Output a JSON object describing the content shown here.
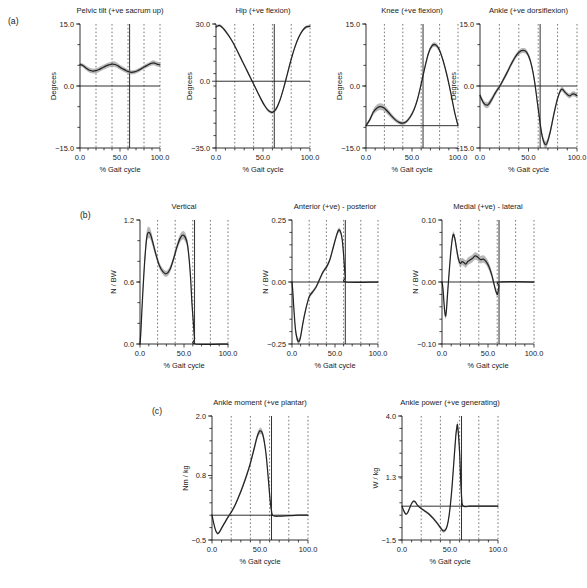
{
  "figure": {
    "width": 587,
    "height": 588,
    "background": "#ffffff",
    "curve_color": "#242424",
    "band_color": "#8c8c8c",
    "grid_color": "#4d4d4d",
    "axis_color": "#1a1a1a"
  },
  "row_labels": {
    "a": "(a)",
    "b": "(b)",
    "c": "(c)"
  },
  "common": {
    "xlabel": "% Gait cycle",
    "xticks": [
      0.0,
      50.0,
      100.0
    ],
    "xticklabels": [
      "0.0",
      "50.0",
      "100.0"
    ],
    "xlim": [
      0,
      100
    ],
    "xminor_step": 10,
    "grid_dotted_x": [
      20,
      40,
      60,
      80
    ],
    "toe_off": 62
  },
  "chart_data": [
    {
      "id": "pelvic-tilt",
      "type": "line",
      "row": "a",
      "title": "Pelvic tilt (+ve sacrum up)",
      "xlabel": "% Gait cycle",
      "ylabel": "Degrees",
      "ylim": [
        -15.0,
        15.0
      ],
      "yticks": [
        -15.0,
        0.0,
        15.0
      ],
      "yticklabels": [
        "−15.0",
        "0.0",
        "15.0"
      ],
      "yminor_step": 5.0,
      "reference_line_y": 0.0,
      "toe_off": 62,
      "x": [
        0,
        4,
        8,
        12,
        16,
        20,
        24,
        28,
        32,
        36,
        40,
        44,
        48,
        52,
        56,
        60,
        64,
        68,
        72,
        76,
        80,
        84,
        88,
        92,
        96,
        100
      ],
      "mean": [
        5.2,
        4.9,
        4.3,
        3.8,
        3.6,
        3.7,
        4.0,
        4.4,
        4.8,
        5.1,
        5.3,
        5.2,
        4.8,
        4.3,
        3.9,
        3.5,
        3.3,
        3.4,
        3.7,
        4.1,
        4.6,
        5.0,
        5.4,
        5.6,
        5.3,
        5.1
      ],
      "sd": [
        0.45,
        0.5,
        0.55,
        0.6,
        0.6,
        0.6,
        0.6,
        0.6,
        0.6,
        0.6,
        0.65,
        0.65,
        0.6,
        0.6,
        0.55,
        0.5,
        0.5,
        0.5,
        0.5,
        0.5,
        0.5,
        0.5,
        0.55,
        0.6,
        0.6,
        0.55
      ]
    },
    {
      "id": "hip",
      "type": "line",
      "row": "a",
      "title": "Hip (+ve flexion)",
      "xlabel": "% Gait cycle",
      "ylabel": "Degrees",
      "ylim": [
        -35.0,
        30.0
      ],
      "yticks": [
        -35.0,
        0.0,
        30.0
      ],
      "yticklabels": [
        "−35.0",
        "0.0",
        "30.0"
      ],
      "yminor_step": 6.5,
      "reference_line_y": 0.0,
      "toe_off": 62,
      "x": [
        0,
        4,
        8,
        12,
        16,
        20,
        24,
        28,
        32,
        36,
        40,
        44,
        48,
        52,
        56,
        60,
        64,
        68,
        72,
        76,
        80,
        84,
        88,
        92,
        96,
        100
      ],
      "mean": [
        28.5,
        29.2,
        27.5,
        25.0,
        22.0,
        18.5,
        14.5,
        10.5,
        6.5,
        2.5,
        -1.5,
        -5.5,
        -9.5,
        -13.0,
        -15.5,
        -16.3,
        -14.5,
        -10.0,
        -3.5,
        4.0,
        11.5,
        18.0,
        23.0,
        26.5,
        28.5,
        28.8
      ],
      "sd": [
        0.7,
        0.7,
        0.7,
        0.7,
        0.7,
        0.7,
        0.7,
        0.7,
        0.7,
        0.7,
        0.7,
        0.7,
        0.8,
        0.8,
        0.8,
        0.8,
        0.8,
        0.8,
        0.8,
        0.8,
        0.8,
        0.8,
        0.7,
        0.7,
        0.7,
        0.7
      ]
    },
    {
      "id": "knee",
      "type": "line",
      "row": "a",
      "title": "Knee (+ve flexion)",
      "xlabel": "% Gait cycle",
      "ylabel": "Degrees",
      "ylim": [
        -15.0,
        15.0
      ],
      "yticks": [
        -15.0,
        0.0,
        15.0
      ],
      "yticklabels": [
        "−15.0",
        "0.0",
        "15.0"
      ],
      "yminor_step": 5.0,
      "reference_line_y": -9.6,
      "toe_off": 62,
      "x": [
        0,
        4,
        8,
        12,
        16,
        20,
        24,
        28,
        32,
        36,
        40,
        44,
        48,
        52,
        56,
        60,
        64,
        68,
        72,
        76,
        80,
        84,
        88,
        92,
        96,
        100
      ],
      "mean": [
        -9.6,
        -8.2,
        -6.3,
        -5.3,
        -5.0,
        -5.4,
        -6.3,
        -7.3,
        -8.2,
        -8.8,
        -9.0,
        -8.6,
        -7.5,
        -5.8,
        -3.2,
        0.5,
        4.5,
        8.0,
        9.8,
        9.9,
        8.6,
        6.0,
        2.6,
        -1.5,
        -6.0,
        -9.6
      ],
      "sd": [
        0.3,
        0.5,
        0.7,
        0.8,
        0.8,
        0.75,
        0.7,
        0.6,
        0.5,
        0.45,
        0.4,
        0.4,
        0.4,
        0.4,
        0.4,
        0.45,
        0.5,
        0.5,
        0.55,
        0.55,
        0.5,
        0.5,
        0.45,
        0.4,
        0.35,
        0.3
      ]
    },
    {
      "id": "ankle-angle",
      "type": "line",
      "row": "a",
      "title": "Ankle (+ve dorsiflexion)",
      "xlabel": "% Gait cycle",
      "ylabel": "Degrees",
      "ylim": [
        -15.0,
        15.0
      ],
      "yticks": [
        -15.0,
        0.0,
        15.0
      ],
      "yticklabels": [
        "−15.0",
        "0.0",
        "15.0"
      ],
      "yminor_step": 5.0,
      "reference_line_y": 0.0,
      "toe_off": 62,
      "x": [
        0,
        4,
        8,
        12,
        16,
        20,
        24,
        28,
        32,
        36,
        40,
        44,
        48,
        52,
        56,
        60,
        64,
        68,
        72,
        76,
        80,
        84,
        88,
        92,
        96,
        100
      ],
      "mean": [
        -2.3,
        -4.2,
        -4.6,
        -3.3,
        -1.6,
        -0.2,
        1.5,
        3.3,
        5.2,
        6.9,
        8.1,
        8.6,
        8.2,
        6.0,
        1.5,
        -5.5,
        -12.0,
        -14.2,
        -11.5,
        -7.0,
        -3.0,
        -0.8,
        -1.6,
        -2.4,
        -1.9,
        -2.3
      ],
      "sd": [
        0.6,
        0.7,
        0.75,
        0.7,
        0.6,
        0.55,
        0.55,
        0.55,
        0.55,
        0.6,
        0.6,
        0.6,
        0.6,
        0.6,
        0.65,
        0.7,
        0.8,
        0.85,
        0.8,
        0.7,
        0.6,
        0.55,
        0.6,
        0.6,
        0.6,
        0.6
      ]
    },
    {
      "id": "grf-vertical",
      "type": "line",
      "row": "b",
      "title": "Vertical",
      "xlabel": "% Gait cycle",
      "ylabel": "N / BW",
      "ylim": [
        0.0,
        1.2
      ],
      "yticks": [
        0.0,
        0.6,
        1.2
      ],
      "yticklabels": [
        "0.0",
        "0.6",
        "1.2"
      ],
      "yminor_step": 0.2,
      "reference_line_y": null,
      "toe_off": 62,
      "x": [
        0,
        1,
        2,
        4,
        6,
        8,
        10,
        12,
        14,
        18,
        22,
        26,
        30,
        34,
        38,
        42,
        46,
        50,
        54,
        57,
        59,
        60,
        61,
        62,
        63,
        100
      ],
      "mean": [
        0.0,
        0.12,
        0.3,
        0.62,
        0.88,
        1.05,
        1.08,
        1.06,
        1.0,
        0.87,
        0.76,
        0.7,
        0.68,
        0.72,
        0.82,
        0.94,
        1.03,
        1.05,
        0.96,
        0.7,
        0.4,
        0.28,
        0.16,
        0.05,
        0.0,
        0.0
      ],
      "sd": [
        0.0,
        0.03,
        0.04,
        0.05,
        0.06,
        0.06,
        0.055,
        0.05,
        0.045,
        0.035,
        0.03,
        0.03,
        0.03,
        0.03,
        0.03,
        0.035,
        0.04,
        0.04,
        0.04,
        0.035,
        0.03,
        0.025,
        0.02,
        0.01,
        0.0,
        0.0
      ]
    },
    {
      "id": "grf-anterior-posterior",
      "type": "line",
      "row": "b",
      "title": "Anterior (+ve) - posterior",
      "xlabel": "% Gait cycle",
      "ylabel": "N / BW",
      "ylim": [
        -0.25,
        0.25
      ],
      "yticks": [
        -0.25,
        0.0,
        0.25
      ],
      "yticklabels": [
        "−0.25",
        "0.00",
        "0.25"
      ],
      "yminor_step": 0.05,
      "reference_line_y": 0.0,
      "toe_off": 62,
      "x": [
        0,
        1,
        2,
        4,
        6,
        8,
        10,
        13,
        16,
        20,
        24,
        28,
        32,
        36,
        40,
        44,
        48,
        52,
        55,
        58,
        60,
        61,
        62,
        63,
        100
      ],
      "mean": [
        0.0,
        -0.04,
        -0.1,
        -0.19,
        -0.23,
        -0.24,
        -0.22,
        -0.16,
        -0.11,
        -0.06,
        -0.04,
        -0.02,
        0.01,
        0.04,
        0.06,
        0.09,
        0.14,
        0.19,
        0.21,
        0.18,
        0.11,
        0.06,
        0.02,
        0.0,
        0.0
      ],
      "sd": [
        0.0,
        0.005,
        0.008,
        0.01,
        0.012,
        0.012,
        0.011,
        0.01,
        0.009,
        0.008,
        0.007,
        0.007,
        0.007,
        0.007,
        0.008,
        0.008,
        0.009,
        0.01,
        0.01,
        0.009,
        0.008,
        0.006,
        0.004,
        0.0,
        0.0
      ]
    },
    {
      "id": "grf-medial-lateral",
      "type": "line",
      "row": "b",
      "title": "Medial (+ve) - lateral",
      "xlabel": "% Gait cycle",
      "ylabel": "N / BW",
      "ylim": [
        -0.1,
        0.1
      ],
      "yticks": [
        -0.1,
        0.0,
        0.1
      ],
      "yticklabels": [
        "−0.10",
        "0.00",
        "0.10"
      ],
      "yminor_step": 0.02,
      "reference_line_y": 0.0,
      "toe_off": 62,
      "x": [
        0,
        1,
        2,
        3,
        4,
        5,
        6,
        8,
        10,
        12,
        14,
        16,
        18,
        20,
        22,
        24,
        26,
        28,
        30,
        33,
        36,
        39,
        42,
        45,
        48,
        51,
        54,
        56,
        58,
        60,
        61,
        62,
        63,
        100
      ],
      "mean": [
        0.0,
        -0.01,
        -0.03,
        -0.048,
        -0.055,
        -0.042,
        -0.02,
        0.02,
        0.055,
        0.076,
        0.07,
        0.052,
        0.036,
        0.03,
        0.033,
        0.031,
        0.029,
        0.033,
        0.035,
        0.038,
        0.042,
        0.04,
        0.036,
        0.037,
        0.033,
        0.025,
        0.012,
        0.0,
        -0.012,
        -0.02,
        -0.015,
        -0.006,
        0.0,
        0.0
      ],
      "sd": [
        0.0,
        0.002,
        0.003,
        0.004,
        0.005,
        0.005,
        0.005,
        0.005,
        0.005,
        0.005,
        0.005,
        0.006,
        0.006,
        0.006,
        0.006,
        0.006,
        0.006,
        0.006,
        0.006,
        0.006,
        0.006,
        0.006,
        0.006,
        0.006,
        0.006,
        0.006,
        0.005,
        0.005,
        0.004,
        0.004,
        0.003,
        0.002,
        0.0,
        0.0
      ]
    },
    {
      "id": "ankle-moment",
      "type": "line",
      "row": "c",
      "title": "Ankle moment (+ve plantar)",
      "xlabel": "% Gait cycle",
      "ylabel": "Nm / kg",
      "ylim": [
        -0.5,
        2.0
      ],
      "yticks": [
        -0.5,
        0.8,
        2.0
      ],
      "yticklabels": [
        "−0.5",
        "0.8",
        "2.0"
      ],
      "yminor_step": 0.25,
      "reference_line_y": 0.0,
      "toe_off": 62,
      "x": [
        0,
        2,
        4,
        6,
        8,
        10,
        13,
        16,
        20,
        24,
        28,
        32,
        36,
        40,
        44,
        47,
        50,
        53,
        56,
        58,
        60,
        61,
        62,
        63,
        66,
        70,
        80,
        90,
        100
      ],
      "mean": [
        0.0,
        -0.18,
        -0.32,
        -0.37,
        -0.33,
        -0.26,
        -0.16,
        -0.06,
        0.06,
        0.2,
        0.38,
        0.58,
        0.8,
        1.05,
        1.35,
        1.58,
        1.7,
        1.62,
        1.28,
        0.88,
        0.42,
        0.22,
        0.08,
        0.0,
        -0.02,
        -0.02,
        -0.01,
        0.0,
        0.0
      ],
      "sd": [
        0.0,
        0.015,
        0.02,
        0.025,
        0.025,
        0.025,
        0.025,
        0.025,
        0.025,
        0.03,
        0.035,
        0.04,
        0.045,
        0.05,
        0.055,
        0.06,
        0.065,
        0.06,
        0.055,
        0.045,
        0.035,
        0.025,
        0.015,
        0.008,
        0.008,
        0.008,
        0.008,
        0.005,
        0.0
      ]
    },
    {
      "id": "ankle-power",
      "type": "line",
      "row": "c",
      "title": "Ankle power (+ve generating)",
      "xlabel": "% Gait cycle",
      "ylabel": "W / kg",
      "ylim": [
        -1.5,
        4.0
      ],
      "yticks": [
        -1.5,
        1.3,
        4.0
      ],
      "yticklabels": [
        "−1.5",
        "1.3",
        "4.0"
      ],
      "yminor_step": 0.55,
      "reference_line_y": 0.0,
      "toe_off": 62,
      "x": [
        0,
        2,
        4,
        6,
        8,
        10,
        12,
        14,
        16,
        20,
        24,
        28,
        32,
        36,
        40,
        43,
        46,
        48,
        50,
        52,
        54,
        56,
        57,
        58,
        60,
        61,
        62,
        63,
        66,
        70,
        80,
        90,
        100
      ],
      "mean": [
        0.0,
        -0.22,
        -0.35,
        -0.28,
        -0.08,
        0.12,
        0.22,
        0.18,
        0.05,
        -0.1,
        -0.22,
        -0.35,
        -0.52,
        -0.72,
        -0.95,
        -1.1,
        -1.0,
        -0.7,
        -0.1,
        0.8,
        1.95,
        3.1,
        3.45,
        3.55,
        2.4,
        1.3,
        0.45,
        0.05,
        -0.02,
        0.0,
        0.0,
        0.0,
        0.0
      ],
      "sd": [
        0.0,
        0.03,
        0.04,
        0.04,
        0.04,
        0.04,
        0.05,
        0.05,
        0.05,
        0.05,
        0.05,
        0.055,
        0.06,
        0.065,
        0.07,
        0.075,
        0.08,
        0.08,
        0.09,
        0.1,
        0.12,
        0.14,
        0.15,
        0.15,
        0.13,
        0.1,
        0.07,
        0.04,
        0.02,
        0.01,
        0.01,
        0.0,
        0.0
      ]
    }
  ]
}
